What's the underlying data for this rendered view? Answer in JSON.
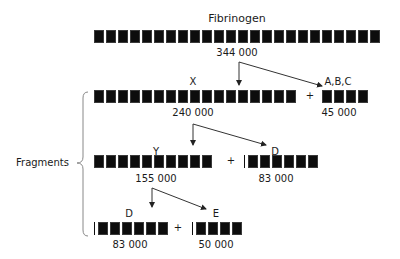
{
  "diagram": {
    "title": "Fibrinogen",
    "side_label": "Fragments",
    "plus": "+",
    "molecules": [
      {
        "id": "fibrinogen",
        "label": "Fibrinogen",
        "mass": "344 000"
      },
      {
        "id": "X",
        "label": "X",
        "mass": "240 000"
      },
      {
        "id": "ABC",
        "label": "A,B,C",
        "mass": "45 000"
      },
      {
        "id": "Y",
        "label": "Y",
        "mass": "155 000"
      },
      {
        "id": "D1",
        "label": "D",
        "mass": "83 000"
      },
      {
        "id": "D2",
        "label": "D",
        "mass": "83 000"
      },
      {
        "id": "E",
        "label": "E",
        "mass": "50 000"
      }
    ],
    "edges": [
      {
        "from": "fibrinogen",
        "to": "X"
      },
      {
        "from": "fibrinogen",
        "to": "ABC"
      },
      {
        "from": "X",
        "to": "Y"
      },
      {
        "from": "X",
        "to": "D1"
      },
      {
        "from": "Y",
        "to": "D2"
      },
      {
        "from": "Y",
        "to": "E"
      }
    ],
    "colors": {
      "bar": "#0d0d0d",
      "line": "#333333",
      "brace": "#888888"
    }
  }
}
